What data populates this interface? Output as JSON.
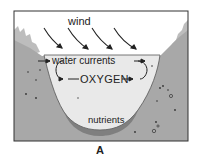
{
  "figure": {
    "panel_label": "A",
    "labels": {
      "wind": "wind",
      "water_currents": "water currents",
      "oxygen": "OXYGEN",
      "nutrients": "nutrients"
    },
    "colors": {
      "frame": "#333333",
      "sky": "#ffffff",
      "land": "#a8a8a8",
      "water": "#e8e8e8",
      "trees": "#b8b8b8",
      "ink": "#222222"
    }
  }
}
